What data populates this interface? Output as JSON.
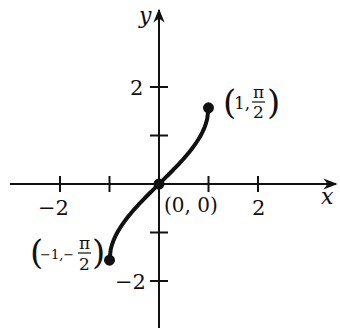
{
  "chart_data": {
    "type": "line",
    "title": "",
    "function": "y = arcsin(x)",
    "xlabel": "x",
    "ylabel": "y",
    "xlim": [
      -3,
      3.5
    ],
    "ylim": [
      -2.4,
      3.5
    ],
    "grid": false,
    "x_ticks": [
      -2,
      -1,
      1,
      2
    ],
    "x_tick_labels": [
      {
        "value": -2,
        "label": "−2"
      },
      {
        "value": 2,
        "label": "2"
      }
    ],
    "y_ticks": [
      -2,
      -1,
      1,
      2
    ],
    "y_tick_labels": [
      {
        "value": 2,
        "label": "2"
      },
      {
        "value": -2,
        "label": "−2"
      }
    ],
    "series": [
      {
        "name": "arcsin",
        "x": [
          -1,
          -0.9,
          -0.75,
          -0.5,
          -0.25,
          0,
          0.25,
          0.5,
          0.75,
          0.9,
          1
        ],
        "y": [
          -1.5708,
          -1.1198,
          -0.8481,
          -0.5236,
          -0.2527,
          0,
          0.2527,
          0.5236,
          0.8481,
          1.1198,
          1.5708
        ]
      }
    ],
    "points": [
      {
        "x": 1,
        "y": 1.5708,
        "label": "(1, π/2)"
      },
      {
        "x": 0,
        "y": 0,
        "label": "(0, 0)"
      },
      {
        "x": -1,
        "y": -1.5708,
        "label": "(−1, −π/2)"
      }
    ]
  },
  "labels": {
    "x_axis": "x",
    "y_axis": "y",
    "origin": "(0, 0)",
    "top_point": {
      "open": "(",
      "x": "1,",
      "num": "π",
      "den": "2",
      "close": ")"
    },
    "bottom_point": {
      "open": "(",
      "x": "−1,−",
      "num": "π",
      "den": "2",
      "close": ")"
    },
    "xtick_neg2": "−2",
    "xtick_2": "2",
    "ytick_2": "2",
    "ytick_neg2": "−2"
  }
}
